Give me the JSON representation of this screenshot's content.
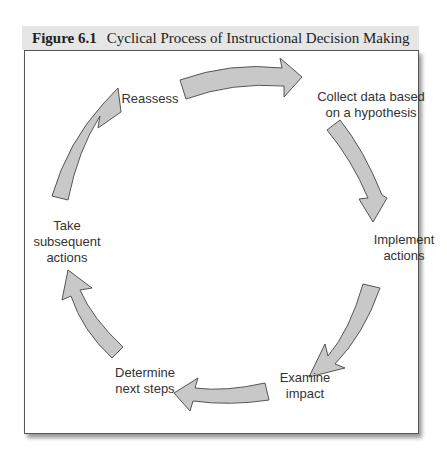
{
  "figure": {
    "number": "Figure 6.1",
    "title": "Cyclical Process of Instructional Decision Making"
  },
  "steps": [
    {
      "id": "collect",
      "line1": "Collect data based",
      "line2": "on a hypothesis"
    },
    {
      "id": "implement",
      "line1": "Implement",
      "line2": "actions"
    },
    {
      "id": "examine",
      "line1": "Examine",
      "line2": "impact"
    },
    {
      "id": "determine",
      "line1": "Determine",
      "line2": "next steps"
    },
    {
      "id": "take",
      "line1": "Take",
      "line2": "subsequent",
      "line3": "actions"
    },
    {
      "id": "reassess",
      "line1": "Reassess"
    }
  ],
  "colors": {
    "arrow_fill": "#c8c8c8",
    "arrow_stroke": "#555555",
    "title_bg": "#e6e6e6"
  }
}
